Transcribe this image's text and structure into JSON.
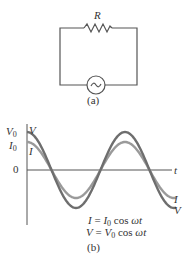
{
  "figure_a": {
    "resistor_label": "R",
    "caption": "(a)",
    "source": "ac-source-icon"
  },
  "figure_b": {
    "caption": "(b)",
    "y_labels": {
      "v0": "V",
      "v0_sub": "0",
      "i0": "I",
      "i0_sub": "0",
      "zero": "0"
    },
    "x_label": "t",
    "curve_labels": {
      "v_start": "V",
      "i_start": "I",
      "i_end": "I",
      "v_end": "V"
    },
    "eq1": {
      "lhs": "I",
      "eq": " = ",
      "amp": "I",
      "sub": "0",
      "rest": " cos ",
      "wt": "ωt"
    },
    "eq2": {
      "lhs": "V",
      "eq": " = ",
      "amp": "V",
      "sub": "0",
      "rest": " cos ",
      "wt": "ωt"
    },
    "colors": {
      "voltage": "#6e6e6e",
      "current": "#9a9a9a",
      "axis": "#555555"
    }
  }
}
